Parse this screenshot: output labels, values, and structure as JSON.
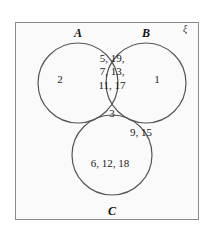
{
  "figure": {
    "type": "venn-diagram-3-set",
    "universe_symbol": "ξ",
    "stroke_color": "#555555",
    "border_color": "#8a8a8a",
    "background_color": "#fafafa",
    "text_color": "#1a1a1a"
  },
  "sets": {
    "a": {
      "label": "A",
      "cx": 78,
      "cy": 83,
      "r": 40
    },
    "b": {
      "label": "B",
      "cx": 146,
      "cy": 83,
      "r": 40
    },
    "c": {
      "label": "C",
      "cx": 112,
      "cy": 155,
      "r": 40
    }
  },
  "regions": {
    "a_only": "2",
    "b_only": "1",
    "ab_only": "5, 19,\n7, 13,\n11, 17",
    "abc": "3",
    "bc_only": "9, 15",
    "ac_only": "",
    "c_only": "6, 12, 18",
    "outside": ""
  },
  "chart_data": {
    "type": "venn",
    "title": "",
    "sets": [
      "A",
      "B",
      "C"
    ],
    "universe_label": "ξ",
    "regions": [
      {
        "id": "a_only",
        "sets": [
          "A"
        ],
        "members": [
          2
        ]
      },
      {
        "id": "b_only",
        "sets": [
          "B"
        ],
        "members": [
          1
        ]
      },
      {
        "id": "c_only",
        "sets": [
          "C"
        ],
        "members": [
          6,
          12,
          18
        ]
      },
      {
        "id": "ab_only",
        "sets": [
          "A",
          "B"
        ],
        "members": [
          5,
          19,
          7,
          13,
          11,
          17
        ]
      },
      {
        "id": "bc_only",
        "sets": [
          "B",
          "C"
        ],
        "members": [
          9,
          15
        ]
      },
      {
        "id": "ac_only",
        "sets": [
          "A",
          "C"
        ],
        "members": []
      },
      {
        "id": "abc",
        "sets": [
          "A",
          "B",
          "C"
        ],
        "members": [
          3
        ]
      },
      {
        "id": "outside",
        "sets": [],
        "members": []
      }
    ]
  }
}
